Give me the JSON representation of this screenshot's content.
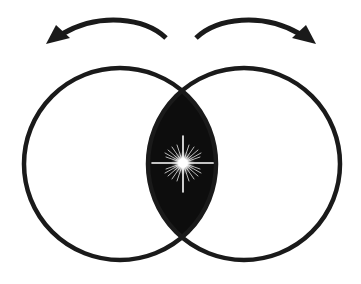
{
  "diagram": {
    "description": "Two overlapping circles (vesica piscis) with a dark lens-shaped intersection containing a radiant white star, and two curved arrows above pointing outward left and right",
    "colors": {
      "background": "#ffffff",
      "stroke": "#1a1a1a",
      "lens_fill": "#0d0d0d",
      "star": "#ffffff"
    },
    "circles": [
      {
        "id": "left-circle",
        "cx": 120,
        "cy": 164,
        "r": 96
      },
      {
        "id": "right-circle",
        "cx": 244,
        "cy": 164,
        "r": 96
      }
    ],
    "intersection": {
      "shape": "vesica-lens",
      "top": [
        182,
        91
      ],
      "bottom": [
        182,
        237
      ],
      "fill": "dark"
    },
    "star": {
      "center": [
        183,
        163
      ],
      "type": "radiant-sparkle"
    },
    "arrows": [
      {
        "id": "left-arrow",
        "direction": "left",
        "from": [
          166,
          38
        ],
        "to": [
          46,
          44
        ]
      },
      {
        "id": "right-arrow",
        "direction": "right",
        "from": [
          196,
          38
        ],
        "to": [
          316,
          44
        ]
      }
    ],
    "labels": []
  }
}
